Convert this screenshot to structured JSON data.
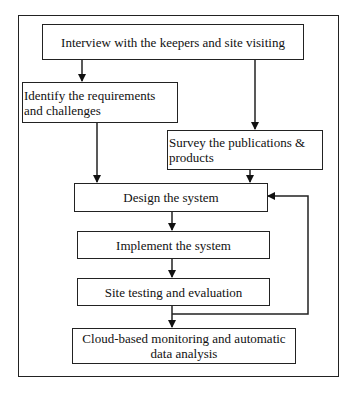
{
  "diagram": {
    "type": "flowchart",
    "nodes": [
      {
        "id": "interview",
        "label": "Interview with the keepers and site visiting"
      },
      {
        "id": "identify",
        "label": "Identify the requirements and challenges",
        "lines": [
          "Identify the requirements",
          "and challenges"
        ]
      },
      {
        "id": "survey",
        "label": "Survey the publications & products",
        "lines": [
          "Survey the publications &",
          "products"
        ]
      },
      {
        "id": "design",
        "label": "Design the system"
      },
      {
        "id": "implement",
        "label": "Implement the system"
      },
      {
        "id": "testing",
        "label": "Site testing and evaluation"
      },
      {
        "id": "cloud",
        "label": "Cloud-based monitoring and automatic data analysis",
        "lines": [
          "Cloud-based monitoring and automatic",
          "data analysis"
        ]
      }
    ],
    "edges": [
      {
        "from": "interview",
        "to": "identify"
      },
      {
        "from": "interview",
        "to": "survey"
      },
      {
        "from": "identify",
        "to": "design"
      },
      {
        "from": "survey",
        "to": "design"
      },
      {
        "from": "design",
        "to": "implement"
      },
      {
        "from": "implement",
        "to": "testing"
      },
      {
        "from": "testing",
        "to": "cloud"
      },
      {
        "from": "testing",
        "to": "design",
        "kind": "feedback-loop"
      }
    ]
  }
}
